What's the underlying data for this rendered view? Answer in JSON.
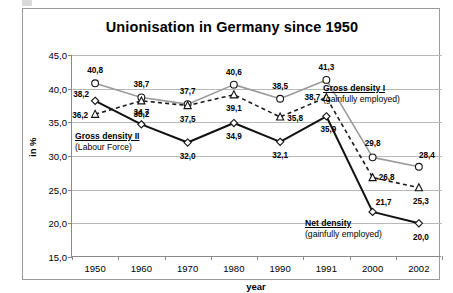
{
  "chart_data": {
    "type": "line",
    "title": "Unionisation in Germany since 1950",
    "xlabel": "year",
    "ylabel": "in %",
    "categories": [
      "1950",
      "1960",
      "1970",
      "1980",
      "1990",
      "1991",
      "2000",
      "2002"
    ],
    "ylim": [
      15.0,
      45.0
    ],
    "ytick_labels": [
      "15,0",
      "20,0",
      "25,0",
      "30,0",
      "35,0",
      "40,0",
      "45,0"
    ],
    "ytick_values": [
      15.0,
      20.0,
      25.0,
      30.0,
      35.0,
      40.0,
      45.0
    ],
    "grid": true,
    "legend_position": "inline-annotations",
    "series": [
      {
        "name": "Gross density I (gainfully employed)",
        "marker": "circle",
        "line": "solid",
        "color": "#9a9a9a",
        "values": [
          40.8,
          38.7,
          37.7,
          40.6,
          38.5,
          41.3,
          29.8,
          28.4
        ],
        "labels": [
          "40,8",
          "38,7",
          "37,7",
          "40,6",
          "38,5",
          "41,3",
          "29,8",
          "28,4"
        ]
      },
      {
        "name": "Net density (gainfully employed)",
        "marker": "triangle",
        "line": "dashed",
        "color": "#1a1a1a",
        "values": [
          36.2,
          38.2,
          37.5,
          39.1,
          35.8,
          38.7,
          26.8,
          25.3
        ],
        "labels": [
          "36,2",
          "38,2",
          "37,5",
          "39,1",
          "35,8",
          "38,7",
          "26,8",
          "25,3"
        ]
      },
      {
        "name": "Gross density II (Labour Force)",
        "marker": "diamond",
        "line": "solid",
        "color": "#111111",
        "values": [
          38.2,
          34.7,
          32.0,
          34.9,
          32.1,
          35.9,
          21.7,
          20.0
        ],
        "labels": [
          "38,2",
          "34,7",
          "32,0",
          "34,9",
          "32,1",
          "35,9",
          "21,7",
          "20,0"
        ]
      }
    ],
    "annotations": [
      {
        "line1": "Gross density I",
        "line2": "(gainfully employed)"
      },
      {
        "line1": "Gross density II",
        "line2": "(Labour Force)"
      },
      {
        "line1": "Net density",
        "line2": "(gainfully employed)"
      }
    ]
  }
}
